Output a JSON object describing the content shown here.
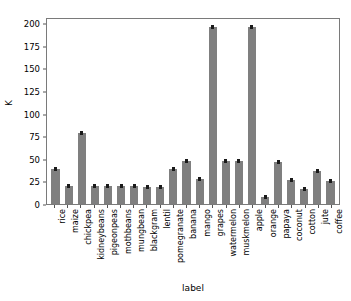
{
  "chart_data": {
    "type": "bar",
    "title": "",
    "xlabel": "label",
    "ylabel": "K",
    "ylim": [
      0,
      207
    ],
    "grid": false,
    "legend": null,
    "bar_color": "#7f7f7f",
    "error_bars": true,
    "yticks": [
      0,
      25,
      50,
      75,
      100,
      125,
      150,
      175,
      200
    ],
    "ytick_labels": [
      "0",
      "25",
      "50",
      "75",
      "100",
      "125",
      "150",
      "175",
      "200"
    ],
    "categories": [
      "rice",
      "maize",
      "chickpea",
      "kidneybeans",
      "pigeonpeas",
      "mothbeans",
      "mungbean",
      "blackgram",
      "lentil",
      "pomegranate",
      "banana",
      "mango",
      "grapes",
      "watermelon",
      "muskmelon",
      "apple",
      "orange",
      "papaya",
      "coconut",
      "cotton",
      "jute",
      "coffee"
    ],
    "values": [
      39,
      20,
      79,
      20,
      20,
      20,
      20,
      19,
      19,
      39,
      48,
      28,
      198,
      48,
      48,
      198,
      8,
      47,
      27,
      17,
      37,
      26
    ]
  }
}
